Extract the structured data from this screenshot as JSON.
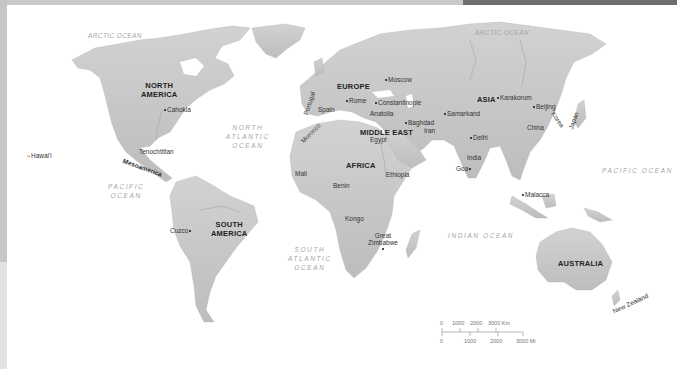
{
  "map": {
    "continents": [
      {
        "label": "NORTH",
        "label2": "AMERICA",
        "x": 141,
        "y": 84
      },
      {
        "label": "EUROPE",
        "x": 337,
        "y": 84
      },
      {
        "label": "ASIA",
        "x": 477,
        "y": 97
      },
      {
        "label": "MIDDLE EAST",
        "x": 361,
        "y": 130
      },
      {
        "label": "AFRICA",
        "x": 346,
        "y": 163
      },
      {
        "label": "SOUTH",
        "label2": "AMERICA",
        "x": 212,
        "y": 222
      },
      {
        "label": "AUSTRALIA",
        "x": 557,
        "y": 261
      }
    ],
    "places": [
      {
        "label": "Cahokia",
        "x": 163,
        "y": 108,
        "dot": "before"
      },
      {
        "label": "Hawai'i",
        "x": 31,
        "y": 153,
        "dot": "before"
      },
      {
        "label": "Tenochtitlan",
        "x": 140,
        "y": 149,
        "dot": "none"
      },
      {
        "label": "Mesoamerica",
        "x": 120,
        "y": 156,
        "dot": "none",
        "rotate": 20
      },
      {
        "label": "Cuzco",
        "x": 170,
        "y": 229,
        "dot": "after"
      },
      {
        "label": "Mali",
        "x": 295,
        "y": 172,
        "dot": "none"
      },
      {
        "label": "Benin",
        "x": 332,
        "y": 183,
        "dot": "none"
      },
      {
        "label": "Kongo",
        "x": 345,
        "y": 217,
        "dot": "none"
      },
      {
        "label": "Great",
        "x": 375,
        "y": 233,
        "dot": "none"
      },
      {
        "label": "Zimbabwe",
        "x": 368,
        "y": 240,
        "dot": "none"
      },
      {
        "label": "Ethiopia",
        "x": 386,
        "y": 173,
        "dot": "none"
      },
      {
        "label": "Egypt",
        "x": 369,
        "y": 137,
        "dot": "none"
      },
      {
        "label": "Portugal",
        "x": 307,
        "y": 102,
        "dot": "none",
        "rotate": -70
      },
      {
        "label": "Spain",
        "x": 317,
        "y": 108,
        "dot": "none"
      },
      {
        "label": "Morocco",
        "x": 300,
        "y": 130,
        "dot": "none",
        "rotate": -45
      },
      {
        "label": "Rome",
        "x": 346,
        "y": 98,
        "dot": "before"
      },
      {
        "label": "Moscow",
        "x": 386,
        "y": 77,
        "dot": "before"
      },
      {
        "label": "Constantinople",
        "x": 376,
        "y": 101,
        "dot": "before"
      },
      {
        "label": "Anatolia",
        "x": 370,
        "y": 111,
        "dot": "none"
      },
      {
        "label": "Baghdad",
        "x": 406,
        "y": 120,
        "dot": "before"
      },
      {
        "label": "Iran",
        "x": 424,
        "y": 128,
        "dot": "none"
      },
      {
        "label": "Samarkand",
        "x": 444,
        "y": 111,
        "dot": "before"
      },
      {
        "label": "Karakorum",
        "x": 497,
        "y": 95,
        "dot": "before"
      },
      {
        "label": "Beijing",
        "x": 532,
        "y": 104,
        "dot": "before"
      },
      {
        "label": "Korea",
        "x": 551,
        "y": 117,
        "dot": "none",
        "rotate": 55
      },
      {
        "label": "Japan",
        "x": 567,
        "y": 115,
        "dot": "none",
        "rotate": -70
      },
      {
        "label": "China",
        "x": 527,
        "y": 125,
        "dot": "none"
      },
      {
        "label": "Delhi",
        "x": 470,
        "y": 135,
        "dot": "before"
      },
      {
        "label": "India",
        "x": 466,
        "y": 155,
        "dot": "none"
      },
      {
        "label": "Goa",
        "x": 456,
        "y": 166,
        "dot": "after"
      },
      {
        "label": "Malacca",
        "x": 522,
        "y": 193,
        "dot": "before"
      },
      {
        "label": "New Zealand",
        "x": 627,
        "y": 296,
        "dot": "none",
        "rotate": -25
      }
    ],
    "oceans": [
      {
        "label": "ARCTIC OCEAN",
        "x": 117,
        "y": 36,
        "style": "tight"
      },
      {
        "label": "ARCTIC OCEAN",
        "x": 477,
        "y": 32,
        "style": "tight"
      },
      {
        "label": "NORTH",
        "label2": "ATLANTIC",
        "label3": "OCEAN",
        "x": 245,
        "y": 126
      },
      {
        "label": "PACIFIC",
        "label2": "OCEAN",
        "x": 108,
        "y": 183
      },
      {
        "label": "SOUTH",
        "label2": "ATLANTIC",
        "label3": "OCEAN",
        "x": 288,
        "y": 247
      },
      {
        "label": "INDIAN OCEAN",
        "x": 448,
        "y": 232,
        "style": "spaced"
      },
      {
        "label": "PACIFIC OCEAN",
        "x": 601,
        "y": 168,
        "style": "spaced"
      }
    ]
  },
  "scale_bar": {
    "km_labels": [
      "0",
      "1000",
      "2000",
      "3000 Km"
    ],
    "mi_labels": [
      "0",
      "1000",
      "2000",
      "3000 Mi"
    ]
  }
}
